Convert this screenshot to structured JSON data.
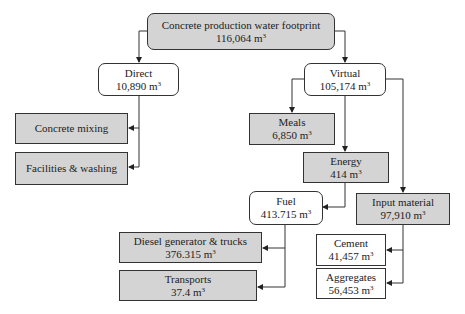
{
  "diagram": {
    "title": "Concrete production water footprint",
    "unit": "m",
    "unit_exp": "3",
    "nodes": {
      "root": {
        "label": "Concrete production water footprint",
        "value": "116,064 m"
      },
      "direct": {
        "label": "Direct",
        "value": "10,890 m"
      },
      "virtual": {
        "label": "Virtual",
        "value": "105,174 m"
      },
      "concrete_mixing": {
        "label": "Concrete mixing"
      },
      "facilities_washing": {
        "label": "Facilities & washing"
      },
      "meals": {
        "label": "Meals",
        "value": "6,850 m"
      },
      "energy": {
        "label": "Energy",
        "value": "414 m"
      },
      "fuel": {
        "label": "Fuel",
        "value": "413.715 m"
      },
      "input_material": {
        "label": "Input material",
        "value": "97,910 m"
      },
      "diesel": {
        "label": "Diesel generator & trucks",
        "value": "376.315 m"
      },
      "transports": {
        "label": "Transports",
        "value": "37.4 m"
      },
      "cement": {
        "label": "Cement",
        "value": "41,457 m"
      },
      "aggregates": {
        "label": "Aggregates",
        "value": "56,453 m"
      }
    },
    "edges": [
      [
        "root",
        "direct"
      ],
      [
        "root",
        "virtual"
      ],
      [
        "direct",
        "concrete_mixing"
      ],
      [
        "direct",
        "facilities_washing"
      ],
      [
        "virtual",
        "meals"
      ],
      [
        "virtual",
        "energy"
      ],
      [
        "virtual",
        "input_material"
      ],
      [
        "energy",
        "fuel"
      ],
      [
        "fuel",
        "diesel"
      ],
      [
        "fuel",
        "transports"
      ],
      [
        "input_material",
        "cement"
      ],
      [
        "input_material",
        "aggregates"
      ]
    ],
    "colors": {
      "gray_fill": "#d4d4d4",
      "white_fill": "#ffffff",
      "stroke": "#333333"
    }
  }
}
